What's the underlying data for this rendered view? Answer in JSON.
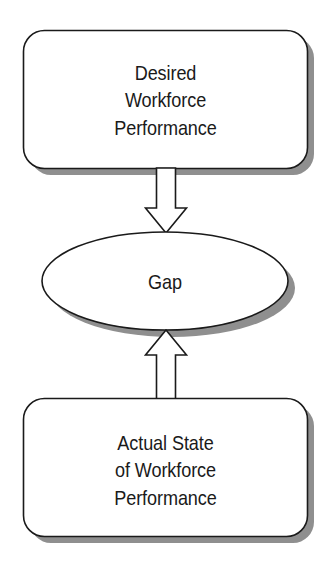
{
  "diagram": {
    "type": "flow-diagram",
    "background_color": "#ffffff",
    "stroke_color": "#1a1a1a",
    "shadow_color": "#8a8a8a",
    "text_color": "#1a1a1a",
    "nodes": [
      {
        "id": "desired",
        "shape": "rounded-rectangle",
        "label": "Desired\nWorkforce\nPerformance"
      },
      {
        "id": "gap",
        "shape": "ellipse",
        "label": "Gap"
      },
      {
        "id": "actual",
        "shape": "rounded-rectangle",
        "label": "Actual State\nof Workforce\nPerformance"
      }
    ],
    "connectors": [
      {
        "id": "arrow-down",
        "from": "desired",
        "to": "gap",
        "direction": "down",
        "style": "block-arrow-outline"
      },
      {
        "id": "arrow-up",
        "from": "actual",
        "to": "gap",
        "direction": "up",
        "style": "block-arrow-outline"
      }
    ]
  }
}
